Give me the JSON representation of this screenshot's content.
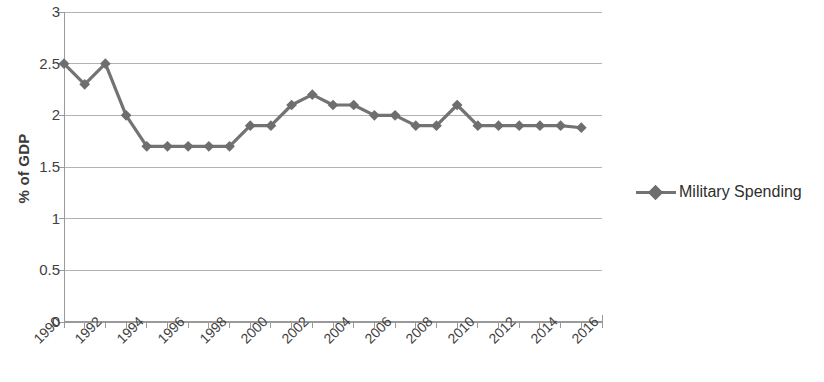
{
  "chart_data": {
    "type": "line",
    "title": "",
    "xlabel": "",
    "ylabel": "% of GDP",
    "ylim": [
      0,
      3
    ],
    "xlim": [
      1990,
      2016
    ],
    "yticks": [
      "0",
      "0.5",
      "1",
      "1.5",
      "2",
      "2.5",
      "3"
    ],
    "ytick_values": [
      0,
      0.5,
      1,
      1.5,
      2,
      2.5,
      3
    ],
    "xticks": [
      "1990",
      "1992",
      "1994",
      "1996",
      "1998",
      "2000",
      "2002",
      "2004",
      "2006",
      "2008",
      "2010",
      "2012",
      "2014",
      "2016"
    ],
    "xtick_values": [
      1990,
      1992,
      1994,
      1996,
      1998,
      2000,
      2002,
      2004,
      2006,
      2008,
      2010,
      2012,
      2014,
      2016
    ],
    "grid": true,
    "grid_axis": "y",
    "legend_position": "right",
    "series": [
      {
        "name": "Military Spending",
        "color": "#737373",
        "marker": "diamond",
        "x": [
          1990,
          1991,
          1992,
          1993,
          1994,
          1995,
          1996,
          1997,
          1998,
          1999,
          2000,
          2001,
          2002,
          2003,
          2004,
          2005,
          2006,
          2007,
          2008,
          2009,
          2010,
          2011,
          2012,
          2013,
          2014,
          2015
        ],
        "values": [
          2.5,
          2.3,
          2.5,
          2.0,
          1.7,
          1.7,
          1.7,
          1.7,
          1.7,
          1.9,
          1.9,
          2.1,
          2.2,
          2.1,
          2.1,
          2.0,
          2.0,
          1.9,
          1.9,
          2.1,
          1.9,
          1.9,
          1.9,
          1.9,
          1.9,
          1.88
        ]
      }
    ]
  },
  "legend": {
    "entries": [
      {
        "label": "Military Spending",
        "color": "#737373"
      }
    ]
  },
  "axes": {
    "y_title": "% of GDP"
  },
  "colors": {
    "series": "#737373",
    "marker": "#6e6e6e",
    "grid": "#b3b3b3",
    "axis": "#9a9a9a",
    "text": "#3f3f3f"
  }
}
